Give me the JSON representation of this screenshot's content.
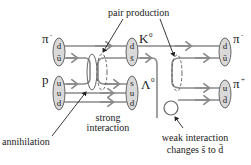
{
  "diagram": {
    "type": "quark-flow diagram",
    "colors": {
      "line": "#8a8a8a",
      "hadron_fill": "#d9d9d9",
      "text": "#222222"
    },
    "hadrons": {
      "pi_minus_in": {
        "symbol": "π",
        "charge": "-",
        "quarks": [
          "d",
          "ū"
        ]
      },
      "proton": {
        "symbol": "p",
        "charge": "",
        "quarks": [
          "u",
          "u",
          "d"
        ]
      },
      "kaon": {
        "symbol": "K",
        "charge": "0",
        "quarks": [
          "d",
          "s̄"
        ]
      },
      "lambda": {
        "symbol": "Λ",
        "charge": "0",
        "quarks": [
          "s",
          "u",
          "d"
        ]
      },
      "pi_minus_out": {
        "symbol": "π",
        "charge": "-",
        "quarks": [
          "d",
          "ū"
        ]
      },
      "pi_plus_out": {
        "symbol": "π",
        "charge": "+",
        "quarks": [
          "u",
          "d̄"
        ]
      }
    },
    "annotations": {
      "pair_production": "pair production",
      "strong_line1": "strong",
      "strong_line2": "interaction",
      "annihilation": "annihilation",
      "weak_line1": "weak interaction",
      "weak_line2": "changes s̄ to d̄"
    }
  }
}
